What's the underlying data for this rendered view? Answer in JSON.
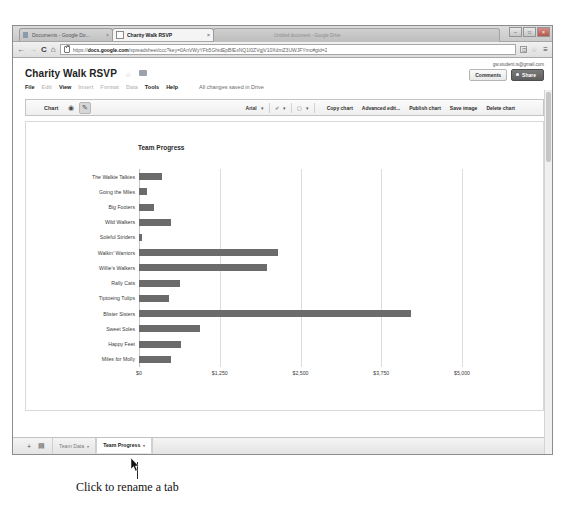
{
  "browser": {
    "tabs": [
      {
        "label": "Documents - Google Do...",
        "close": "×",
        "active": false
      },
      {
        "label": "Charity Walk RSVP",
        "close": "×",
        "active": true
      }
    ],
    "ghost_tab_text": "Untitled document - Google Drive",
    "window_controls": {
      "minimize": "–",
      "maximize": "□",
      "close": "×"
    },
    "nav": {
      "back": "←",
      "forward": "→",
      "reload": "C",
      "home": "⌂"
    },
    "url": {
      "scheme": "https://",
      "domain": "docs.google.com",
      "path": "/spreadsheet/ccc?key=0AnVWyYFb5GhidEpBfExNQ1I0ZVgjV10XdmZ3UWJFYmc#gid=2"
    },
    "omnibox_icons": {
      "save": "☑",
      "star": "☆",
      "menu": "≡"
    }
  },
  "docs": {
    "title": "Charity Walk RSVP",
    "star_icon": "☆",
    "menus": [
      {
        "label": "File",
        "dim": false
      },
      {
        "label": "Edit",
        "dim": true
      },
      {
        "label": "View",
        "dim": false
      },
      {
        "label": "Insert",
        "dim": true
      },
      {
        "label": "Format",
        "dim": true
      },
      {
        "label": "Data",
        "dim": true
      },
      {
        "label": "Tools",
        "dim": false
      },
      {
        "label": "Help",
        "dim": false
      }
    ],
    "save_status": "All changes saved in Drive",
    "account_email": "gw.student.ts@gmail.com",
    "comments_label": "Comments",
    "share_label": "Share"
  },
  "chart_toolbar": {
    "chart_label": "Chart",
    "eye_icon": "◉",
    "pencil_icon": "✎",
    "font_name": "Arial",
    "caret": "▾",
    "paint_icon": "✐",
    "border_icon": "▢",
    "buttons": [
      "Copy chart",
      "Advanced edit...",
      "Publish chart",
      "Save image",
      "Delete chart"
    ]
  },
  "chart_data": {
    "type": "bar",
    "orientation": "horizontal",
    "title": "Team Progress",
    "xlabel": "",
    "ylabel": "",
    "xlim": [
      0,
      5000
    ],
    "grid": true,
    "legend": false,
    "bar_color": "#6b6b6b",
    "xticks": [
      "$0",
      "$1,250",
      "$2,500",
      "$3,750",
      "$5,000"
    ],
    "xtick_values": [
      0,
      1250,
      2500,
      3750,
      5000
    ],
    "categories": [
      "The Walkie Talkies",
      "Going the Miles",
      "Big Footers",
      "Wild Walkers",
      "Soleful Striders",
      "Walkin' Warriors",
      "Willie's Walkers",
      "Rally Cats",
      "Tiptoeing Tulips",
      "Blister Sisters",
      "Sweet Soles",
      "Happy Feet",
      "Miles for Molly"
    ],
    "values": [
      350,
      125,
      230,
      490,
      50,
      2150,
      1980,
      630,
      460,
      4210,
      940,
      650,
      490
    ]
  },
  "sheet_bar": {
    "add_icon": "+",
    "list_icon": "▤",
    "tabs": [
      {
        "label": "Team Data",
        "caret": "▾",
        "active": false
      },
      {
        "label": "Team Progress",
        "caret": "▾",
        "active": true
      }
    ]
  },
  "annotation": {
    "text": "Click to rename a tab"
  }
}
